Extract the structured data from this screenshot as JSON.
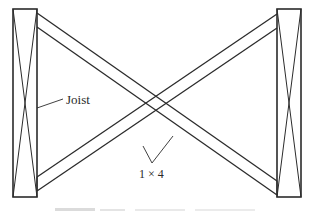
{
  "figure": {
    "type": "cross-bridging-diagram",
    "labels": {
      "joist": "Joist",
      "brace": "1 × 4"
    },
    "caption_visible": false,
    "colors": {
      "line": "#2b2b2b",
      "background": "#ffffff"
    }
  }
}
